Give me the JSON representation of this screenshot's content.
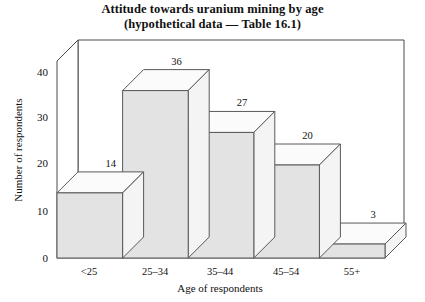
{
  "chart_data": {
    "type": "bar",
    "title": "Attitude towards uranium mining by age",
    "subtitle": "(hypothetical data — Table 16.1)",
    "xlabel": "Age of respondents",
    "ylabel": "Number of respondents",
    "categories": [
      "<25",
      "25–34",
      "35–44",
      "45–54",
      "55+"
    ],
    "values": [
      14,
      36,
      27,
      20,
      3
    ],
    "ylim": [
      0,
      45
    ],
    "yticks": [
      0,
      10,
      20,
      30,
      40
    ],
    "ytick_labels": [
      "0",
      "10",
      "20",
      "30",
      "40"
    ],
    "value_labels": [
      "14",
      "36",
      "27",
      "20",
      "3"
    ],
    "grid": false,
    "legend": false,
    "style": "3d-isometric",
    "colors": {
      "bar_front": "#e3e3e3",
      "bar_top": "#fbfbfb",
      "bar_side": "#f4f4f4",
      "outline": "#5a5a5a",
      "frame": "#4a4a4a",
      "background": "#ffffff",
      "text": "#111111"
    }
  }
}
